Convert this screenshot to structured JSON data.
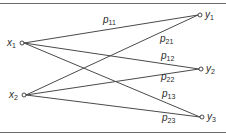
{
  "diagram": {
    "type": "bipartite-transition-graph",
    "inputs": [
      {
        "id": "x1",
        "base": "x",
        "sub": "1",
        "pos": [
          22,
          43
        ]
      },
      {
        "id": "x2",
        "base": "x",
        "sub": "2",
        "pos": [
          24,
          95
        ]
      }
    ],
    "outputs": [
      {
        "id": "y1",
        "base": "y",
        "sub": "1",
        "pos": [
          200,
          15
        ]
      },
      {
        "id": "y2",
        "base": "y",
        "sub": "2",
        "pos": [
          201,
          69
        ]
      },
      {
        "id": "y3",
        "base": "y",
        "sub": "3",
        "pos": [
          202,
          117
        ]
      }
    ],
    "edges": [
      {
        "from": "x1",
        "to": "y1",
        "label_base": "p",
        "label_sub": "11"
      },
      {
        "from": "x1",
        "to": "y2",
        "label_base": "p",
        "label_sub": "12"
      },
      {
        "from": "x1",
        "to": "y3",
        "label_base": "p",
        "label_sub": "13"
      },
      {
        "from": "x2",
        "to": "y1",
        "label_base": "p",
        "label_sub": "21"
      },
      {
        "from": "x2",
        "to": "y2",
        "label_base": "p",
        "label_sub": "22"
      },
      {
        "from": "x2",
        "to": "y3",
        "label_base": "p",
        "label_sub": "23"
      }
    ]
  }
}
